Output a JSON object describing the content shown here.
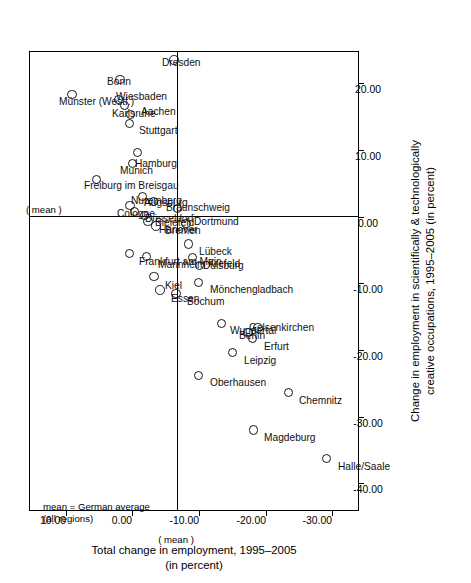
{
  "chart_data": {
    "type": "scatter",
    "title": "",
    "xlabel": "Change in employment in scientifically & technologically creative occupations, 1995–2005 (in percent)",
    "ylabel": "Total change in employment, 1995–2005 (in percent)",
    "xlim": [
      -44.0,
      25.0
    ],
    "ylim": [
      -34.0,
      15.5
    ],
    "xticks": [
      "20.00",
      "10.00",
      "0.00",
      "-10.00",
      "-20.00",
      "-30.00",
      "-40.00"
    ],
    "xtick_values": [
      20,
      10,
      0,
      -10,
      -20,
      -30,
      -40
    ],
    "yticks": [
      "10.00",
      "0.00",
      "-10.00",
      "-20.00",
      "-30.00"
    ],
    "ytick_values": [
      10,
      0,
      -10,
      -20,
      -30
    ],
    "grid": false,
    "legend": null,
    "mean_lines": {
      "x_mean": 0.0,
      "y_mean": -6.6,
      "label": "( mean )",
      "note": "mean = German average\n(all regions)"
    },
    "points": [
      {
        "label": "Münster (Westf.)",
        "x": 18.3,
        "y": 9.2
      },
      {
        "label": "Freiburg im Breisgau",
        "x": 5.6,
        "y": 5.5
      },
      {
        "label": "Bonn",
        "x": 20.6,
        "y": 2.0
      },
      {
        "label": "Karlsruhe",
        "x": 16.7,
        "y": 1.3
      },
      {
        "label": "Wiesbaden",
        "x": 17.6,
        "y": 2.2
      },
      {
        "label": "Stuttgart",
        "x": 14.0,
        "y": 0.6
      },
      {
        "label": "Aachen",
        "x": 15.3,
        "y": 0.4
      },
      {
        "label": "Munich",
        "x": 8.0,
        "y": 0.1
      },
      {
        "label": "Hamburg",
        "x": 9.6,
        "y": -0.6
      },
      {
        "label": "Cologne",
        "x": 1.7,
        "y": 0.5
      },
      {
        "label": "Frankfurt am Main",
        "x": -5.5,
        "y": 0.6
      },
      {
        "label": "Düsseldorf",
        "x": 0.8,
        "y": -0.2
      },
      {
        "label": "Bielefeld",
        "x": 0.2,
        "y": -1.7
      },
      {
        "label": "Hanover",
        "x": -0.7,
        "y": -2.2
      },
      {
        "label": "Nuremberg",
        "x": 3.0,
        "y": -1.4
      },
      {
        "label": "Bremen",
        "x": -1.4,
        "y": -3.4
      },
      {
        "label": "Augsburg",
        "x": 2.3,
        "y": -3.0
      },
      {
        "label": "Braunschweig",
        "x": 1.2,
        "y": -6.6
      },
      {
        "label": "Dortmund",
        "x": -1.0,
        "y": -7.9
      },
      {
        "label": "Lübeck",
        "x": -4.1,
        "y": -8.3
      },
      {
        "label": "Duisburg",
        "x": -6.1,
        "y": -8.9
      },
      {
        "label": "Krefeld",
        "x": -7.3,
        "y": -9.9
      },
      {
        "label": "Mannheim",
        "x": -6.0,
        "y": -2.0
      },
      {
        "label": "Kiel",
        "x": -9.0,
        "y": -3.1
      },
      {
        "label": "Essen",
        "x": -11.0,
        "y": -4.0
      },
      {
        "label": "Bochum",
        "x": -11.5,
        "y": -6.4
      },
      {
        "label": "Mönchengladbach",
        "x": -9.9,
        "y": -9.8
      },
      {
        "label": "Oberhausen",
        "x": -23.8,
        "y": -9.8
      },
      {
        "label": "Leipzig",
        "x": -20.4,
        "y": -14.9
      },
      {
        "label": "Wuppertal",
        "x": -16.0,
        "y": -13.2
      },
      {
        "label": "Erfurt",
        "x": -18.3,
        "y": -17.9
      },
      {
        "label": "Berlin",
        "x": -17.4,
        "y": -17.2
      },
      {
        "label": "Gelsenkirchen",
        "x": -16.7,
        "y": -18.7
      },
      {
        "label": "Chemnitz",
        "x": -26.4,
        "y": -23.3
      },
      {
        "label": "Magdeburg",
        "x": -32.0,
        "y": -18.0
      },
      {
        "label": "Halle/Saale",
        "x": -36.3,
        "y": -29.0
      },
      {
        "label": "Dresden",
        "x": 23.5,
        "y": -6.1
      }
    ]
  }
}
